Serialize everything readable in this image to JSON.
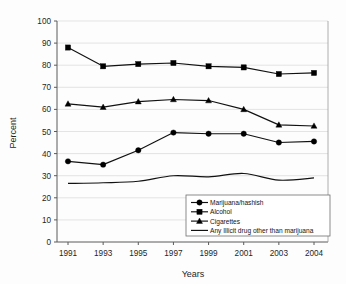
{
  "chart_data": {
    "type": "line",
    "title": "",
    "xlabel": "Years",
    "ylabel": "Percent",
    "categories": [
      "1991",
      "1993",
      "1995",
      "1997",
      "1999",
      "2001",
      "2003",
      "2004"
    ],
    "x": [
      1991,
      1993,
      1995,
      1997,
      1999,
      2001,
      2003,
      2004
    ],
    "ylim": [
      0,
      100
    ],
    "yticks": [
      "0",
      "10",
      "20",
      "30",
      "40",
      "50",
      "60",
      "70",
      "80",
      "90",
      "100"
    ],
    "ytick_values": [
      0,
      10,
      20,
      30,
      40,
      50,
      60,
      70,
      80,
      90,
      100
    ],
    "grid": true,
    "legend_position": "bottom-right",
    "series": [
      {
        "name": "Marijuana/hashish",
        "marker": "circle",
        "values": [
          36.5,
          35.0,
          41.5,
          49.5,
          49.0,
          49.0,
          45.0,
          45.5
        ]
      },
      {
        "name": "Alcohol",
        "marker": "square",
        "values": [
          88.0,
          79.5,
          80.5,
          81.0,
          79.5,
          79.0,
          76.0,
          76.5
        ]
      },
      {
        "name": "Cigarettes",
        "marker": "triangle",
        "values": [
          62.5,
          61.0,
          63.5,
          64.5,
          64.0,
          60.0,
          53.0,
          52.5
        ]
      },
      {
        "name": "Any Illicit drug other than marijuana",
        "marker": "none",
        "values": [
          26.5,
          26.8,
          27.5,
          30.0,
          29.5,
          31.0,
          28.0,
          29.0
        ]
      }
    ],
    "colors": {
      "series": "#111111",
      "grid": "#d8d8d8",
      "axis": "#5a5a5a",
      "background": "#fdfdfd"
    }
  }
}
